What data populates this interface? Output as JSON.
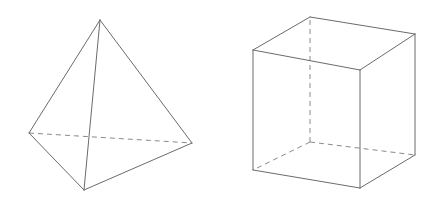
{
  "figure": {
    "background_color": "#ffffff",
    "canvas": {
      "width": 437,
      "height": 207
    },
    "solid_edge_color": "#6b6b6b",
    "hidden_edge_color": "#8a8a8a",
    "stroke_width": 1,
    "hidden_dash_pattern": "5 4"
  },
  "shapes": [
    {
      "name": "tetrahedron",
      "label": "Tetrahedron",
      "vertices": {
        "apex": {
          "x": 100,
          "y": 20
        },
        "left": {
          "x": 29,
          "y": 133
        },
        "right": {
          "x": 192,
          "y": 143
        },
        "front": {
          "x": 84,
          "y": 190
        }
      },
      "solid_edges": [
        {
          "from": "apex",
          "to": "left",
          "d": "M 100 20 L 29 133"
        },
        {
          "from": "apex",
          "to": "right",
          "d": "M 100 20 L 192 143"
        },
        {
          "from": "apex",
          "to": "front",
          "d": "M 100 20 L 84 190"
        },
        {
          "from": "left",
          "to": "front",
          "d": "M 29 133 L 84 190"
        },
        {
          "from": "right",
          "to": "front",
          "d": "M 192 143 L 84 190"
        }
      ],
      "hidden_edges": [
        {
          "from": "left",
          "to": "right",
          "d": "M 29 133 L 192 143"
        }
      ]
    },
    {
      "name": "cube",
      "label": "Cube",
      "vertices": {
        "front_top_left": {
          "x": 253,
          "y": 50
        },
        "front_top_right": {
          "x": 360,
          "y": 70
        },
        "front_bottom_right": {
          "x": 360,
          "y": 188
        },
        "front_bottom_left": {
          "x": 253,
          "y": 170
        },
        "back_top_left": {
          "x": 310,
          "y": 17
        },
        "back_top_right": {
          "x": 415,
          "y": 34
        },
        "back_bottom_right": {
          "x": 415,
          "y": 155
        },
        "back_bottom_left": {
          "x": 310,
          "y": 142
        }
      },
      "solid_edges": [
        {
          "from": "front_top_left",
          "to": "front_top_right",
          "d": "M 253 50 L 360 70"
        },
        {
          "from": "front_top_right",
          "to": "front_bottom_right",
          "d": "M 360 70 L 360 188"
        },
        {
          "from": "front_bottom_right",
          "to": "front_bottom_left",
          "d": "M 360 188 L 253 170"
        },
        {
          "from": "front_bottom_left",
          "to": "front_top_left",
          "d": "M 253 170 L 253 50"
        },
        {
          "from": "back_top_left",
          "to": "back_top_right",
          "d": "M 310 17 L 415 34"
        },
        {
          "from": "back_top_right",
          "to": "back_bottom_right",
          "d": "M 415 34 L 415 155"
        },
        {
          "from": "front_top_left",
          "to": "back_top_left",
          "d": "M 253 50 L 310 17"
        },
        {
          "from": "front_top_right",
          "to": "back_top_right",
          "d": "M 360 70 L 415 34"
        },
        {
          "from": "front_bottom_right",
          "to": "back_bottom_right",
          "d": "M 360 188 L 415 155"
        }
      ],
      "hidden_edges": [
        {
          "from": "back_bottom_left",
          "to": "back_top_left",
          "d": "M 310 142 L 310 17"
        },
        {
          "from": "back_bottom_left",
          "to": "back_bottom_right",
          "d": "M 310 142 L 415 155"
        },
        {
          "from": "back_bottom_left",
          "to": "front_bottom_left",
          "d": "M 310 142 L 253 170"
        }
      ]
    }
  ]
}
